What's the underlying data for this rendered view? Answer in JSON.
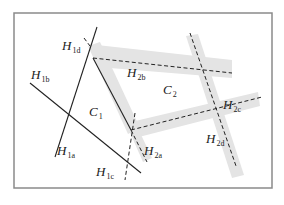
{
  "diagram": {
    "title": "",
    "colors": {
      "frame": "#8a8a8a",
      "line": "#222222",
      "band": "#e4e4e4"
    },
    "frame": {
      "x": 14,
      "y": 13,
      "width": 258,
      "height": 175
    },
    "bands": [
      {
        "name": "band-h2b",
        "points": "97,45 232,60 232,78 110,68"
      },
      {
        "name": "band-c1-right",
        "points": "88,46 100,42 140,128 128,134"
      },
      {
        "name": "band-h2c",
        "points": "131,122 258,92 260,106 135,138"
      },
      {
        "name": "band-h2d",
        "points": "186,36 198,34 244,175 232,178"
      },
      {
        "name": "band-h2a",
        "points": "128,128 136,124 152,158 143,162"
      }
    ],
    "solid_lines": [
      {
        "name": "line-h1a",
        "x1": 97,
        "y1": 27,
        "x2": 55,
        "y2": 157
      },
      {
        "name": "line-h1b",
        "x1": 30,
        "y1": 83,
        "x2": 141,
        "y2": 173
      },
      {
        "name": "line-c1-boundary",
        "x1": 93,
        "y1": 58,
        "x2": 131,
        "y2": 130
      }
    ],
    "dashed_lines": [
      {
        "name": "line-h1d",
        "x1": 84,
        "y1": 38,
        "x2": 90,
        "y2": 46
      },
      {
        "name": "line-h2b",
        "x1": 93,
        "y1": 58,
        "x2": 232,
        "y2": 73
      },
      {
        "name": "line-h2c",
        "x1": 131,
        "y1": 130,
        "x2": 262,
        "y2": 97
      },
      {
        "name": "line-h2d",
        "x1": 190,
        "y1": 33,
        "x2": 236,
        "y2": 166
      },
      {
        "name": "line-h2a",
        "x1": 131,
        "y1": 130,
        "x2": 147,
        "y2": 162
      },
      {
        "name": "line-h1c",
        "x1": 135,
        "y1": 113,
        "x2": 125,
        "y2": 180
      }
    ],
    "labels": [
      {
        "name": "label-h1d",
        "main": "H",
        "sub": "1d",
        "x": 62,
        "y": 50
      },
      {
        "name": "label-h1b",
        "main": "H",
        "sub": "1b",
        "x": 31,
        "y": 79
      },
      {
        "name": "label-h2b",
        "main": "H",
        "sub": "2b",
        "x": 127,
        "y": 77
      },
      {
        "name": "label-c2",
        "main": "C",
        "sub": "2",
        "x": 163,
        "y": 94
      },
      {
        "name": "label-c1",
        "main": "C",
        "sub": "1",
        "x": 89,
        "y": 116
      },
      {
        "name": "label-h2c",
        "main": "H",
        "sub": "2c",
        "x": 223,
        "y": 109
      },
      {
        "name": "label-h1a",
        "main": "H",
        "sub": "1a",
        "x": 57,
        "y": 155
      },
      {
        "name": "label-h2a",
        "main": "H",
        "sub": "2a",
        "x": 144,
        "y": 155
      },
      {
        "name": "label-h2d",
        "main": "H",
        "sub": "2d",
        "x": 206,
        "y": 143
      },
      {
        "name": "label-h1c",
        "main": "H",
        "sub": "1c",
        "x": 96,
        "y": 176
      }
    ]
  }
}
